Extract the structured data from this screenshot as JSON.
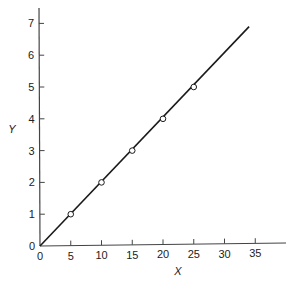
{
  "chart_data": {
    "type": "scatter",
    "title": "",
    "xlabel": "X",
    "ylabel": "Y",
    "xlim": [
      0,
      39
    ],
    "ylim": [
      0,
      7.6
    ],
    "x_ticks": [
      0,
      5,
      10,
      15,
      20,
      25,
      30,
      35
    ],
    "y_ticks": [
      0,
      1,
      2,
      3,
      4,
      5,
      6,
      7
    ],
    "grid": false,
    "legend": null,
    "series": [
      {
        "name": "data points",
        "marker": "open-circle",
        "x": [
          5,
          10,
          15,
          20,
          25
        ],
        "y": [
          1,
          2,
          3,
          4,
          5
        ]
      },
      {
        "name": "fitted line",
        "style": "solid-line",
        "x": [
          0,
          34
        ],
        "y": [
          0,
          6.9
        ]
      }
    ]
  },
  "colors": {
    "line": "#1a1a1a",
    "axis": "#444444",
    "marker_fill": "#ffffff"
  }
}
